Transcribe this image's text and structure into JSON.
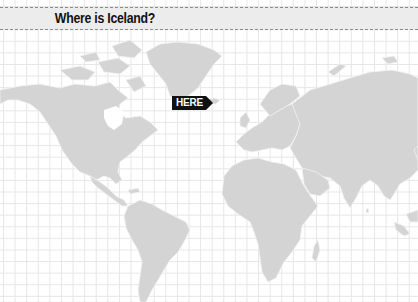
{
  "header": {
    "title": "Where is Iceland?"
  },
  "marker": {
    "label": "HERE",
    "target": "Iceland"
  },
  "colors": {
    "land": "#d4d4d4",
    "border": "#f4f4f4",
    "grid": "#e6e6e6",
    "title_bg": "#ececec",
    "marker_bg": "#111111"
  }
}
